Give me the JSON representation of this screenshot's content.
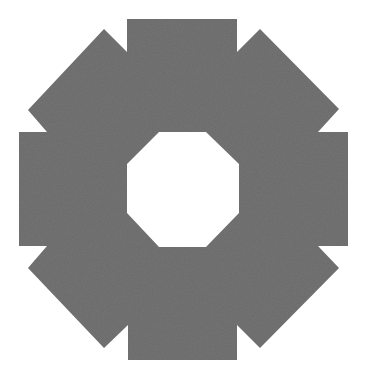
{
  "figure": {
    "fill_color": "#6a6a6a",
    "background_color": "#ffffff",
    "hole_color": "#ffffff",
    "outer_points": "127,19 237,19 237,52 260,29 339,109 318,132 348,132 348,246 318,246 339,268 260,348 237,325 237,360 128,360 128,325 104,348 28,268 47,246 19,246 19,132 47,132 28,110 104,29 127,52",
    "inner_points": "159,132 206,132 239,164 239,213 206,247 159,247 127,213 127,164"
  }
}
